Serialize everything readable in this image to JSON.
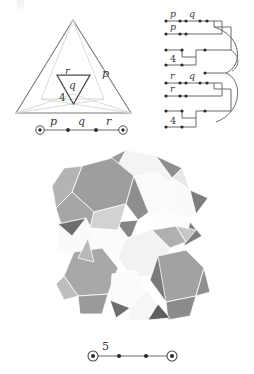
{
  "figure": {
    "colors": {
      "ink": "#3a3a3a",
      "line_dark": "#6b6b6b",
      "line_light": "#d3d3d3",
      "node": "#2b2b2b",
      "background": "#ffffff",
      "solid_light": "#f2f2f2",
      "solid_mid": "#b9b9b9",
      "solid_dark": "#8d8d8d",
      "solid_darker": "#6f6f6f"
    }
  },
  "triangle_panel": {
    "name": "fundamental-triangle",
    "edge_labels": [
      {
        "text": "p",
        "note": "right edge of outer triangle"
      },
      {
        "text": "4",
        "note": "lower left region of outer triangle"
      }
    ],
    "inner_triangle_labels": [
      {
        "text": "r",
        "note": "upper left of inverted inner triangle"
      },
      {
        "text": "q",
        "note": "centre of inverted inner triangle"
      }
    ]
  },
  "coxeter_top": {
    "name": "coxeter-diagram-pqr",
    "type": "linear",
    "nodes": [
      {
        "id": "n1",
        "style": "ringed"
      },
      {
        "id": "n2",
        "style": "filled"
      },
      {
        "id": "n3",
        "style": "filled"
      },
      {
        "id": "n4",
        "style": "ringed"
      }
    ],
    "edges": [
      {
        "from": "n1",
        "to": "n2",
        "label": "p"
      },
      {
        "from": "n2",
        "to": "n3",
        "label": "q"
      },
      {
        "from": "n3",
        "to": "n4",
        "label": "r"
      }
    ]
  },
  "schematic_panel": {
    "name": "branched-coxeter-schematic",
    "rows": [
      {
        "id": "row1",
        "labels": [
          "p",
          "q"
        ],
        "nodes": 5
      },
      {
        "id": "row2",
        "labels": [
          "p"
        ],
        "nodes": 3
      },
      {
        "id": "row3",
        "labels": [],
        "nodes": 2
      },
      {
        "id": "row4",
        "labels": [
          "4"
        ],
        "nodes": 2
      },
      {
        "id": "row5",
        "labels": [
          "r",
          "q"
        ],
        "nodes": 5
      },
      {
        "id": "row6",
        "labels": [
          "r"
        ],
        "nodes": 3
      },
      {
        "id": "row7",
        "labels": [],
        "nodes": 2
      },
      {
        "id": "row8",
        "labels": [
          "4"
        ],
        "nodes": 2
      }
    ]
  },
  "solid_panel": {
    "name": "uniform-polyhedron-rendering",
    "caption": ""
  },
  "coxeter_bottom": {
    "name": "coxeter-diagram-5",
    "type": "linear",
    "nodes": [
      {
        "id": "m1",
        "style": "ringed"
      },
      {
        "id": "m2",
        "style": "filled"
      },
      {
        "id": "m3",
        "style": "filled"
      },
      {
        "id": "m4",
        "style": "ringed"
      }
    ],
    "edges": [
      {
        "from": "m1",
        "to": "m2",
        "label": "5"
      },
      {
        "from": "m2",
        "to": "m3",
        "label": ""
      },
      {
        "from": "m3",
        "to": "m4",
        "label": ""
      }
    ]
  }
}
